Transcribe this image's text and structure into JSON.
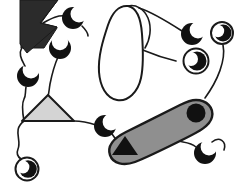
{
  "figure": {
    "canvas": {
      "width": 238,
      "height": 187,
      "background": "#ffffff"
    },
    "palette": {
      "background": "#ffffff",
      "line": "#1a1a1a",
      "solid_dark": "#2b2b2b",
      "crescent_black": "#111111",
      "gray_light": "#d4d4d4",
      "gray_mid": "#8f8f8f"
    },
    "shapes": [
      {
        "id": "arrow-polygon",
        "name": "dark-arrow-polygon",
        "kind": "polygon",
        "fill": "#2b2b2b",
        "position": {
          "x": 21,
          "y": 0,
          "width": 36,
          "height": 55
        }
      },
      {
        "id": "blob-loop",
        "name": "white-blob-loop",
        "kind": "closed-curve",
        "fill": "#ffffff",
        "position": {
          "x": 96,
          "y": 5,
          "width": 55,
          "height": 96
        }
      },
      {
        "id": "triangle",
        "name": "light-gray-triangle",
        "kind": "triangle",
        "fill": "#d4d4d4",
        "position": {
          "x": 22,
          "y": 95,
          "width": 52,
          "height": 26
        }
      },
      {
        "id": "bone",
        "name": "gray-bone-shape",
        "kind": "dumbbell",
        "fill": "#8f8f8f",
        "position": {
          "x": 107,
          "y": 100,
          "width": 106,
          "height": 65
        }
      },
      {
        "id": "bone-circle",
        "name": "bone-inner-circle",
        "kind": "circle",
        "fill": "#111111",
        "position": {
          "x": 190,
          "y": 105,
          "width": 18,
          "height": 18
        }
      },
      {
        "id": "bone-triangle",
        "name": "bone-inner-triangle",
        "kind": "triangle",
        "fill": "#111111",
        "position": {
          "x": 113,
          "y": 136,
          "width": 24,
          "height": 19
        }
      }
    ],
    "crescents": [
      {
        "id": "crescent-1",
        "name": "crescent-top-left",
        "cx": 73,
        "cy": 18,
        "r": 11,
        "rotation": 20
      },
      {
        "id": "crescent-2",
        "name": "crescent-upper-mid-left",
        "cx": 60,
        "cy": 48,
        "r": 11,
        "rotation": 200
      },
      {
        "id": "crescent-3",
        "name": "crescent-left-mid",
        "cx": 28,
        "cy": 76,
        "r": 11,
        "rotation": 250
      },
      {
        "id": "crescent-4",
        "name": "crescent-lower-center",
        "cx": 105,
        "cy": 126,
        "r": 11,
        "rotation": 25
      },
      {
        "id": "crescent-5",
        "name": "crescent-bottom-right",
        "cx": 205,
        "cy": 153,
        "r": 11,
        "rotation": 330
      },
      {
        "id": "crescent-6",
        "name": "crescent-upper-right",
        "cx": 192,
        "cy": 34,
        "r": 11,
        "rotation": 30
      }
    ],
    "eyes": [
      {
        "id": "eye-1",
        "name": "eye-top-right",
        "cx": 222,
        "cy": 33,
        "r": 11
      },
      {
        "id": "eye-2",
        "name": "eye-right-upper",
        "cx": 195,
        "cy": 61,
        "r": 13
      },
      {
        "id": "eye-3",
        "name": "eye-bottom-left",
        "cx": 26,
        "cy": 169,
        "r": 12
      }
    ],
    "connectors": [
      {
        "id": "link-1",
        "name": "connector-arrow-to-crescent1"
      },
      {
        "id": "link-2",
        "name": "connector-arrow-to-crescent3"
      },
      {
        "id": "link-3",
        "name": "connector-crescent2-to-triangle"
      },
      {
        "id": "link-4",
        "name": "connector-triangle-to-eye3"
      },
      {
        "id": "link-5",
        "name": "connector-triangle-to-crescent4"
      },
      {
        "id": "link-6",
        "name": "connector-blob-to-crescent6"
      },
      {
        "id": "link-7",
        "name": "connector-blob-to-eye2"
      },
      {
        "id": "link-8",
        "name": "connector-eye1-to-bone"
      },
      {
        "id": "link-9",
        "name": "connector-bone-to-crescent5"
      }
    ]
  }
}
